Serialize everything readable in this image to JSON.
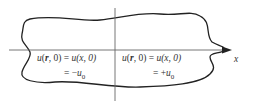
{
  "figure": {
    "axis_label": "x",
    "left_region": {
      "line1_lhs_fn": "u",
      "line1_lhs_arg_vec": "r",
      "line1_lhs_rest": ", 0) = ",
      "line1_rhs": "u(x, 0)",
      "line2_prefix": "= −",
      "line2_var": "u",
      "line2_sub": "0"
    },
    "right_region": {
      "line1_lhs_fn": "u",
      "line1_lhs_arg_vec": "r",
      "line1_lhs_rest": ", 0) = ",
      "line1_rhs": "u(x, 0)",
      "line2_prefix": "= +",
      "line2_var": "u",
      "line2_sub": "0"
    },
    "colors": {
      "curve": "#222222",
      "axis": "#555555",
      "text": "#333333"
    }
  }
}
